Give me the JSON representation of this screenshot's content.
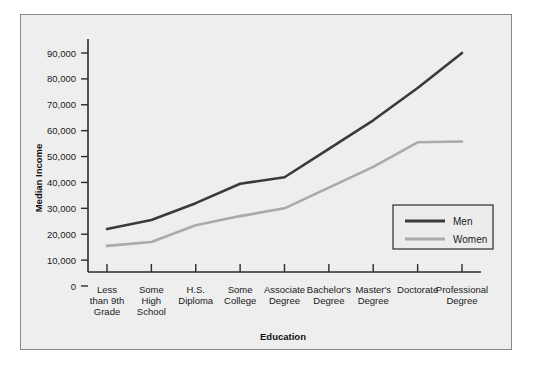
{
  "chart_data": {
    "type": "line",
    "title": "",
    "xlabel": "Education",
    "ylabel": "Median Income",
    "categories": [
      "Less\nthan 9th\nGrade",
      "Some\nHigh\nSchool",
      "H.S.\nDiploma",
      "Some\nCollege",
      "Associate\nDegree",
      "Bachelor's\nDegree",
      "Master's\nDegree",
      "Doctorate",
      "Professional\nDegree"
    ],
    "categories_lines": [
      [
        "Less",
        "than 9th",
        "Grade"
      ],
      [
        "Some",
        "High",
        "School"
      ],
      [
        "H.S.",
        "Diploma"
      ],
      [
        "Some",
        "College"
      ],
      [
        "Associate",
        "Degree"
      ],
      [
        "Bachelor's",
        "Degree"
      ],
      [
        "Master's",
        "Degree"
      ],
      [
        "Doctorate"
      ],
      [
        "Professional",
        "Degree"
      ]
    ],
    "series": [
      {
        "name": "Men",
        "color": "#3a3a3a",
        "width": 2.6,
        "values": [
          22000,
          25500,
          32000,
          39500,
          42000,
          53000,
          64000,
          76500,
          90000
        ]
      },
      {
        "name": "Women",
        "color": "#aaaaaa",
        "width": 2.6,
        "values": [
          15500,
          17000,
          23500,
          27000,
          30000,
          38000,
          46000,
          55500,
          55800
        ]
      }
    ],
    "ylim": [
      0,
      90000
    ],
    "yticks": [
      0,
      10000,
      20000,
      30000,
      40000,
      50000,
      60000,
      70000,
      80000,
      90000
    ],
    "ytick_labels": [
      "0",
      "10,000",
      "20,000",
      "30,000",
      "40,000",
      "50,000",
      "60,000",
      "70,000",
      "80,000",
      "90,000"
    ],
    "grid": false,
    "legend_position": "center-right",
    "legend_entries": [
      {
        "label": "Men",
        "color": "#3a3a3a"
      },
      {
        "label": "Women",
        "color": "#aaaaaa"
      }
    ]
  },
  "figure": {
    "background_color": "#eeeeee",
    "border_color": "#8a8a8a"
  }
}
